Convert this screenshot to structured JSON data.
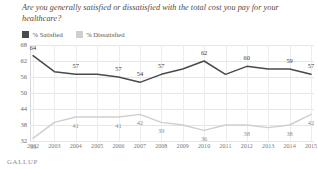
{
  "title": "Are you generally satisfied or dissatisfied with the total cost you pay for your healthcare?",
  "brand": "GALLUP",
  "legend": [
    {
      "label": "% Satisfied",
      "color": "#4a4a4a",
      "swatch": "dark"
    },
    {
      "label": "% Dissatisfied",
      "color": "#cfcfcf",
      "swatch": "light"
    }
  ],
  "chart_data": {
    "type": "line",
    "title": "Are you generally satisfied or dissatisfied with the total cost you pay for your healthcare?",
    "xlabel": "",
    "ylabel": "",
    "ylim": [
      32,
      68
    ],
    "yticks": [
      68,
      62,
      56,
      50,
      44,
      38,
      32
    ],
    "grid": true,
    "legend_position": "top-left",
    "categories": [
      "2002",
      "2003",
      "2004",
      "2005",
      "2006",
      "2007",
      "2008",
      "2009",
      "2010",
      "2011",
      "2012",
      "2013",
      "2014",
      "2015"
    ],
    "series": [
      {
        "name": "% Satisfied",
        "color": "#4a4a4a",
        "values": [
          64,
          58,
          57,
          57,
          56,
          54,
          57,
          59,
          62,
          57,
          60,
          59,
          59,
          57
        ],
        "point_labels": [
          "64",
          "",
          "57",
          "",
          "57",
          "54",
          "57",
          "",
          "62",
          "",
          "60",
          "",
          "59",
          "57"
        ]
      },
      {
        "name": "% Dissatisfied",
        "color": "#cfcfcf",
        "values": [
          33,
          39,
          41,
          41,
          41,
          42,
          39,
          38,
          36,
          38,
          38,
          37,
          38,
          42
        ],
        "point_labels": [
          "33",
          "",
          "41",
          "",
          "41",
          "42",
          "39",
          "",
          "36",
          "",
          "38",
          "",
          "38",
          "42"
        ]
      }
    ]
  }
}
